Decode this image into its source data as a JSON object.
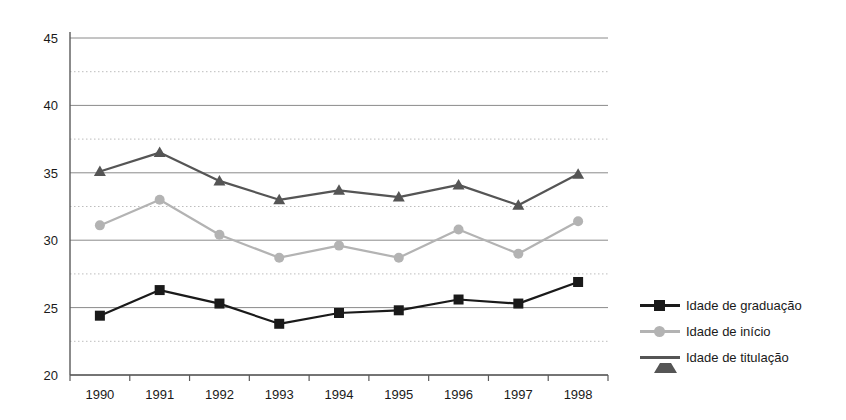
{
  "chart_data": {
    "type": "line",
    "title": "",
    "xlabel": "",
    "ylabel": "",
    "categories": [
      "1990",
      "1991",
      "1992",
      "1993",
      "1994",
      "1995",
      "1996",
      "1997",
      "1998"
    ],
    "ylim": [
      20,
      45
    ],
    "yticks": [
      20,
      25,
      30,
      35,
      40,
      45
    ],
    "yticklabels": [
      "20",
      "25",
      "30",
      "35",
      "40",
      "45"
    ],
    "minor_gridlines": [
      22.5,
      27.5,
      32.5,
      37.5,
      42.5
    ],
    "grid": true,
    "legend_position": "right",
    "series": [
      {
        "name": "Idade de graduação",
        "color": "#1a1a1a",
        "marker": "square",
        "values": [
          24.4,
          26.3,
          25.3,
          23.8,
          24.6,
          24.8,
          25.6,
          25.3,
          26.9
        ]
      },
      {
        "name": "Idade  de início",
        "color": "#b3b3b3",
        "marker": "circle",
        "values": [
          31.1,
          33.0,
          30.4,
          28.7,
          29.6,
          28.7,
          30.8,
          29.0,
          31.4
        ]
      },
      {
        "name": "Idade  de titulação",
        "color": "#555555",
        "marker": "triangle",
        "values": [
          35.1,
          36.5,
          34.4,
          33.0,
          33.7,
          33.2,
          34.1,
          32.6,
          34.9
        ]
      }
    ]
  },
  "legend": {
    "items": [
      {
        "label": "Idade de graduação"
      },
      {
        "label": "Idade  de início"
      },
      {
        "label": "Idade  de titulação"
      }
    ]
  }
}
